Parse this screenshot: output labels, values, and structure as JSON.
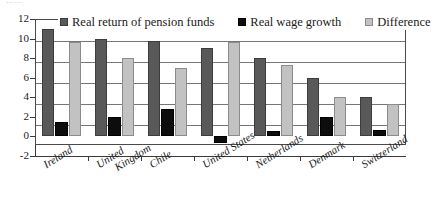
{
  "artifact": {
    "top_cut_text": "……"
  },
  "chart_data": {
    "type": "bar",
    "title": "",
    "subtitle": "",
    "xlabel": "",
    "ylabel": "",
    "ylim": [
      -2,
      12
    ],
    "yticks": [
      12,
      10,
      8,
      6,
      4,
      2,
      0,
      -2
    ],
    "ytick_labels": [
      "12",
      "10",
      "8",
      "6",
      "4",
      "2",
      "0",
      "-2"
    ],
    "grid": true,
    "grid_axis": "y",
    "legend_position": "top-inside",
    "categories": [
      "Ireland",
      "United Kingdom",
      "Chile",
      "United States",
      "Netherlands",
      "Denmark",
      "Switzerland"
    ],
    "series": [
      {
        "name": "Real return of pension funds",
        "color": "#595959",
        "values": [
          11.0,
          10.0,
          9.8,
          9.0,
          8.0,
          6.0,
          4.0
        ]
      },
      {
        "name": "Real wage growth",
        "color": "#0d0d0d",
        "values": [
          1.5,
          2.0,
          2.8,
          -0.7,
          0.6,
          2.0,
          0.7
        ]
      },
      {
        "name": "Difference",
        "color": "#c2c2c2",
        "values": [
          9.7,
          8.0,
          7.0,
          9.7,
          7.3,
          4.0,
          3.3
        ]
      }
    ]
  },
  "legend": {
    "items": [
      {
        "label": "Real return of pension funds",
        "swatch": "dark-gray-swatch"
      },
      {
        "label": "Real wage growth",
        "swatch": "black-swatch"
      },
      {
        "label": "Difference",
        "swatch": "light-gray-swatch"
      }
    ]
  },
  "colors": {
    "series_1": "#595959",
    "series_2": "#0d0d0d",
    "series_3": "#c2c2c2",
    "axis": "#3a3a3a",
    "grid": "#767676",
    "background": "#ffffff"
  }
}
